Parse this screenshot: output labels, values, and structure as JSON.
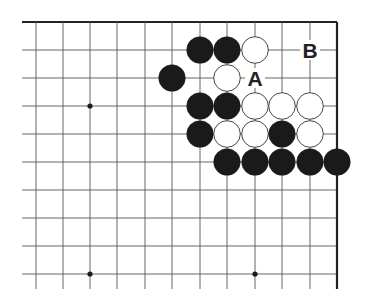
{
  "diagram": {
    "type": "go-board-fragment",
    "grid": {
      "x_lines": [
        36,
        63,
        90,
        117,
        145,
        172,
        200,
        227,
        255,
        282,
        310,
        337
      ],
      "y_lines": [
        22,
        50,
        78,
        106,
        134,
        162,
        190,
        218,
        246,
        274
      ],
      "line_left": 22,
      "line_bottom": 289,
      "top_edge": true,
      "right_edge": true,
      "line_color": "#555555",
      "edge_color": "#222222"
    },
    "star_points": [
      [
        2,
        3
      ],
      [
        2,
        9
      ],
      [
        8,
        9
      ]
    ],
    "stones": [
      {
        "col": 6,
        "row": 1,
        "color": "black"
      },
      {
        "col": 7,
        "row": 1,
        "color": "black"
      },
      {
        "col": 8,
        "row": 1,
        "color": "white"
      },
      {
        "col": 5,
        "row": 2,
        "color": "black"
      },
      {
        "col": 7,
        "row": 2,
        "color": "white"
      },
      {
        "col": 6,
        "row": 3,
        "color": "black"
      },
      {
        "col": 7,
        "row": 3,
        "color": "black"
      },
      {
        "col": 8,
        "row": 3,
        "color": "white"
      },
      {
        "col": 9,
        "row": 3,
        "color": "white"
      },
      {
        "col": 10,
        "row": 3,
        "color": "white"
      },
      {
        "col": 6,
        "row": 4,
        "color": "black"
      },
      {
        "col": 7,
        "row": 4,
        "color": "white"
      },
      {
        "col": 8,
        "row": 4,
        "color": "white"
      },
      {
        "col": 9,
        "row": 4,
        "color": "black"
      },
      {
        "col": 10,
        "row": 4,
        "color": "white"
      },
      {
        "col": 7,
        "row": 5,
        "color": "black"
      },
      {
        "col": 8,
        "row": 5,
        "color": "black"
      },
      {
        "col": 9,
        "row": 5,
        "color": "black"
      },
      {
        "col": 10,
        "row": 5,
        "color": "black"
      },
      {
        "col": 11,
        "row": 5,
        "color": "black"
      }
    ],
    "labels": [
      {
        "col": 8,
        "row": 2,
        "text": "A"
      },
      {
        "col": 10,
        "row": 1,
        "text": "B"
      }
    ],
    "colors": {
      "black_stone": "#1a1a1a",
      "white_stone": "#ffffff",
      "white_stone_border": "#333333",
      "label": "#222222"
    }
  }
}
